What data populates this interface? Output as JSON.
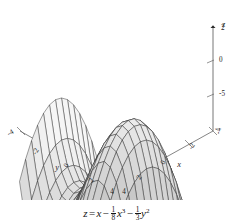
{
  "figure": {
    "title": "",
    "caption_parts": {
      "z": "z",
      "equals": "=",
      "term1": "x",
      "minus1": "−",
      "frac1_num": "1",
      "frac1_den": "8",
      "term2": "x",
      "term2_exp": "3",
      "minus2": "−",
      "frac2_num": "1",
      "frac2_den": "3",
      "term3": "y",
      "term3_exp": "2"
    },
    "caption_plain": "z = x − 1/8 x³ − 1/3 y²"
  },
  "chart_data": {
    "type": "surface",
    "title": "",
    "expression": "z = x - (1/8)x^3 - (1/3)y^2",
    "xlabel": "x",
    "ylabel": "y",
    "zlabel": "z",
    "xlim": [
      -4,
      4
    ],
    "ylim": [
      -4,
      4
    ],
    "zlim": [
      -5,
      2
    ],
    "x_ticks": [
      "-4",
      "-2",
      "0",
      "2",
      "4"
    ],
    "y_ticks": [
      "-4",
      "-2",
      "0",
      "2",
      "4"
    ],
    "z_ticks": [
      "2",
      "0",
      "-5"
    ],
    "grid": true,
    "legend": "none",
    "mesh_lines_u": 17,
    "mesh_lines_v": 17,
    "surface_color": "#d9d9d9",
    "mesh_color": "#2b2b2b",
    "axis_color": "#555555",
    "background": "#ffffff",
    "view": {
      "azimuth": -52,
      "elevation": 22
    }
  },
  "axes": {
    "x": {
      "label": "x",
      "ticks": [
        {
          "value": -4,
          "text": "-4"
        },
        {
          "value": -2,
          "text": "-2"
        },
        {
          "value": 0,
          "text": "0"
        },
        {
          "value": 2,
          "text": "2"
        },
        {
          "value": 4,
          "text": "4"
        }
      ]
    },
    "y": {
      "label": "y",
      "ticks": [
        {
          "value": -4,
          "text": "-4"
        },
        {
          "value": -2,
          "text": "-2"
        },
        {
          "value": 0,
          "text": "0"
        },
        {
          "value": 2,
          "text": "2"
        },
        {
          "value": 4,
          "text": "4"
        }
      ]
    },
    "z": {
      "label": "z",
      "ticks": [
        {
          "value": 2,
          "text": "2"
        },
        {
          "value": 0,
          "text": "0"
        },
        {
          "value": -5,
          "text": "-5"
        }
      ]
    }
  }
}
